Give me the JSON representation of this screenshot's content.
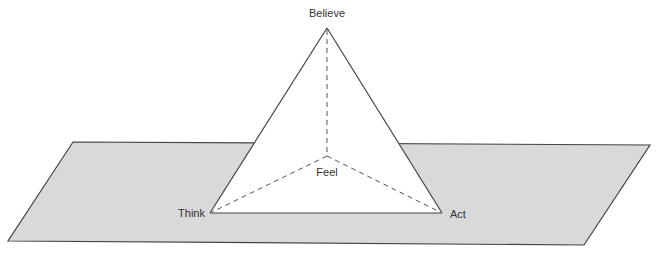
{
  "diagram": {
    "type": "pyramid-on-plane",
    "colors": {
      "plane_fill": "#d9d9d9",
      "plane_stroke": "#444444",
      "pyramid_fill": "#ffffff",
      "edge_stroke": "#444444"
    },
    "labels": {
      "apex": "Believe",
      "center": "Feel",
      "left": "Think",
      "right": "Act"
    }
  }
}
